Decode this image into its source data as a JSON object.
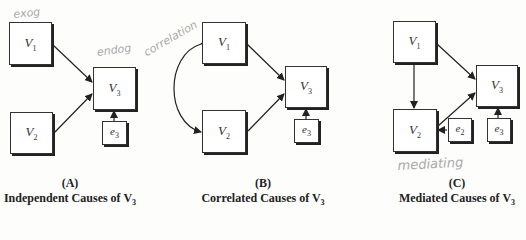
{
  "panels": [
    {
      "id": "A",
      "letter": "(A)",
      "title": "Independent Causes of V",
      "title_sub": "3",
      "nodes": {
        "v1": {
          "name": "V",
          "sub": "1"
        },
        "v2": {
          "name": "V",
          "sub": "2"
        },
        "v3": {
          "name": "V",
          "sub": "3"
        },
        "e3": {
          "name": "e",
          "sub": "3"
        }
      }
    },
    {
      "id": "B",
      "letter": "(B)",
      "title": "Correlated Causes of V",
      "title_sub": "3",
      "nodes": {
        "v1": {
          "name": "V",
          "sub": "1"
        },
        "v2": {
          "name": "V",
          "sub": "2"
        },
        "v3": {
          "name": "V",
          "sub": "3"
        },
        "e3": {
          "name": "e",
          "sub": "3"
        }
      }
    },
    {
      "id": "C",
      "letter": "(C)",
      "title": "Mediated Causes of V",
      "title_sub": "3",
      "nodes": {
        "v1": {
          "name": "V",
          "sub": "1"
        },
        "v2": {
          "name": "V",
          "sub": "2"
        },
        "v3": {
          "name": "V",
          "sub": "3"
        },
        "e2": {
          "name": "e",
          "sub": "2"
        },
        "e3": {
          "name": "e",
          "sub": "3"
        }
      }
    }
  ],
  "annotations": {
    "exog": "exog",
    "endog": "endog",
    "correlation": "correlation",
    "mediating": "mediating"
  },
  "colors": {
    "line": "#222222",
    "handwriting": "#a9a9a9"
  }
}
